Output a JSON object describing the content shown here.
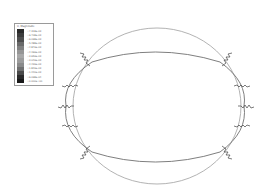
{
  "legend": {
    "title": "U, Magnitude",
    "entries": [
      {
        "value": "+7.318e-03",
        "color": "#2a2a2a"
      },
      {
        "value": "+6.708e-03",
        "color": "#3c3c3c"
      },
      {
        "value": "+6.098e-03",
        "color": "#4e4e4e"
      },
      {
        "value": "+5.488e-03",
        "color": "#6a6a6a"
      },
      {
        "value": "+4.879e-03",
        "color": "#808080"
      },
      {
        "value": "+4.269e-03",
        "color": "#969696"
      },
      {
        "value": "+3.659e-03",
        "color": "#a8a8a8"
      },
      {
        "value": "+3.049e-03",
        "color": "#9c9c9c"
      },
      {
        "value": "+2.439e-03",
        "color": "#8a8a8a"
      },
      {
        "value": "+1.829e-03",
        "color": "#707070"
      },
      {
        "value": "+1.220e-03",
        "color": "#4a4a4a"
      },
      {
        "value": "+6.098e-04",
        "color": "#2a2a2a"
      },
      {
        "value": "+0.000e+00",
        "color": "#1a1a1a"
      }
    ]
  },
  "figure": {
    "undeformed_shape": {
      "type": "circle",
      "cx": 157,
      "cy": 106,
      "rx": 84,
      "ry": 78,
      "color": "#9a9a9a"
    },
    "deformed_shape": {
      "type": "ellipse",
      "cx": 155,
      "cy": 107,
      "rx": 91,
      "ry": 59,
      "color": "#6a6a6a"
    },
    "springs_left": 5,
    "springs_right": 5
  }
}
